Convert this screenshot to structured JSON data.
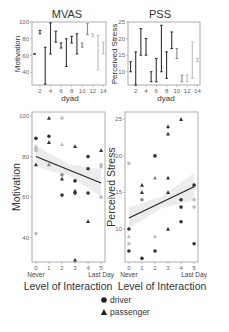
{
  "chart_data": [
    {
      "type": "dumbbell",
      "title": "MVAS",
      "xlabel": "dyad",
      "ylabel": "Motivation",
      "xlim": [
        0.5,
        14.5
      ],
      "ylim": [
        25,
        100
      ],
      "xticks": [
        2,
        4,
        6,
        8,
        10,
        12,
        14
      ],
      "yticks": [
        40,
        60,
        80,
        100
      ],
      "grid": false,
      "ranges": [
        {
          "dyad": 1,
          "low": 62,
          "high": 62,
          "shade": "dark"
        },
        {
          "dyad": 2,
          "low": 86,
          "high": 90,
          "shade": "dark"
        },
        {
          "dyad": 3,
          "low": 26,
          "high": 70,
          "shade": "dark"
        },
        {
          "dyad": 4,
          "low": 62,
          "high": 99,
          "shade": "dark"
        },
        {
          "dyad": 5,
          "low": 76,
          "high": 89,
          "shade": "dark"
        },
        {
          "dyad": 6,
          "low": 69,
          "high": 75,
          "shade": "dark"
        },
        {
          "dyad": 7,
          "low": 47,
          "high": 80,
          "shade": "dark"
        },
        {
          "dyad": 8,
          "low": 75,
          "high": 83,
          "shade": "dark"
        },
        {
          "dyad": 9,
          "low": 62,
          "high": 86,
          "shade": "dark"
        },
        {
          "dyad": 10,
          "low": 70,
          "high": 75,
          "shade": "mid"
        },
        {
          "dyad": 11,
          "low": 85,
          "high": 98,
          "shade": "mid"
        },
        {
          "dyad": 12,
          "low": 83,
          "high": 86,
          "shade": "light"
        },
        {
          "dyad": 13,
          "low": 43,
          "high": 84,
          "shade": "light"
        },
        {
          "dyad": 14,
          "low": 62,
          "high": 76,
          "shade": "light"
        }
      ]
    },
    {
      "type": "dumbbell",
      "title": "PSS",
      "xlabel": "dyad",
      "ylabel": "Perceived Stress",
      "xlim": [
        0.5,
        14.5
      ],
      "ylim": [
        6,
        25
      ],
      "xticks": [
        2,
        4,
        6,
        8,
        10,
        12,
        14
      ],
      "yticks": [
        10,
        15,
        20,
        25
      ],
      "grid": false,
      "ranges": [
        {
          "dyad": 1,
          "low": 10,
          "high": 13,
          "shade": "dark"
        },
        {
          "dyad": 2,
          "low": 6,
          "high": 16,
          "shade": "dark"
        },
        {
          "dyad": 3,
          "low": 15,
          "high": 23,
          "shade": "dark"
        },
        {
          "dyad": 4,
          "low": 15,
          "high": 20,
          "shade": "dark"
        },
        {
          "dyad": 5,
          "low": 7,
          "high": 10,
          "shade": "dark"
        },
        {
          "dyad": 6,
          "low": 7,
          "high": 14,
          "shade": "dark"
        },
        {
          "dyad": 7,
          "low": 10,
          "high": 24,
          "shade": "dark"
        },
        {
          "dyad": 8,
          "low": 8,
          "high": 16,
          "shade": "dark"
        },
        {
          "dyad": 9,
          "low": 17,
          "high": 22,
          "shade": "dark"
        },
        {
          "dyad": 10,
          "low": 14,
          "high": 17,
          "shade": "mid"
        },
        {
          "dyad": 11,
          "low": 7,
          "high": 9,
          "shade": "mid"
        },
        {
          "dyad": 12,
          "low": 7,
          "high": 9,
          "shade": "light"
        },
        {
          "dyad": 13,
          "low": 8,
          "high": 19,
          "shade": "light"
        },
        {
          "dyad": 14,
          "low": 13,
          "high": 14,
          "shade": "light"
        }
      ]
    },
    {
      "type": "scatter",
      "title": "",
      "xlabel": "Level of Interaction",
      "ylabel": "Motivation",
      "xlim": [
        -0.3,
        5.3
      ],
      "ylim": [
        28,
        102
      ],
      "xticks": [
        0,
        1,
        2,
        3,
        4,
        5
      ],
      "xtick_sublabels": {
        "0": "Never",
        "5": "Last Day"
      },
      "yticks": [
        40,
        60,
        80,
        100
      ],
      "grid": false,
      "regression": {
        "x0": 0,
        "y0": 80,
        "x1": 5,
        "y1": 67,
        "ci_band": true
      },
      "points": [
        {
          "x": 0,
          "y": 89,
          "shape": "circle",
          "shade": "dark"
        },
        {
          "x": 0,
          "y": 85,
          "shape": "triangle",
          "shade": "light"
        },
        {
          "x": 0,
          "y": 84,
          "shape": "circle",
          "shade": "light"
        },
        {
          "x": 0,
          "y": 83,
          "shape": "circle",
          "shade": "light"
        },
        {
          "x": 0,
          "y": 76,
          "shape": "triangle",
          "shade": "dark"
        },
        {
          "x": 0,
          "y": 42,
          "shape": "circle",
          "shade": "light"
        },
        {
          "x": 1,
          "y": 99,
          "shape": "triangle",
          "shade": "dark"
        },
        {
          "x": 1,
          "y": 90,
          "shape": "circle",
          "shade": "dark"
        },
        {
          "x": 1,
          "y": 87,
          "shape": "triangle",
          "shade": "dark"
        },
        {
          "x": 1,
          "y": 76,
          "shape": "triangle",
          "shade": "mid"
        },
        {
          "x": 2,
          "y": 99,
          "shape": "circle",
          "shade": "light"
        },
        {
          "x": 2,
          "y": 86,
          "shape": "triangle",
          "shade": "light"
        },
        {
          "x": 2,
          "y": 71,
          "shape": "circle",
          "shade": "mid"
        },
        {
          "x": 2,
          "y": 69,
          "shape": "triangle",
          "shade": "dark"
        },
        {
          "x": 2,
          "y": 61,
          "shape": "circle",
          "shade": "dark"
        },
        {
          "x": 3,
          "y": 85,
          "shape": "triangle",
          "shade": "dark"
        },
        {
          "x": 3,
          "y": 68,
          "shape": "circle",
          "shade": "dark"
        },
        {
          "x": 3,
          "y": 63,
          "shape": "triangle",
          "shade": "dark"
        },
        {
          "x": 3,
          "y": 62,
          "shape": "circle",
          "shade": "dark"
        },
        {
          "x": 3,
          "y": 29,
          "shape": "triangle",
          "shade": "dark"
        },
        {
          "x": 4,
          "y": 80,
          "shape": "circle",
          "shade": "dark"
        },
        {
          "x": 4,
          "y": 74,
          "shape": "circle",
          "shade": "dark"
        },
        {
          "x": 4,
          "y": 62,
          "shape": "circle",
          "shade": "dark"
        },
        {
          "x": 4,
          "y": 48,
          "shape": "triangle",
          "shade": "dark"
        },
        {
          "x": 5,
          "y": 83,
          "shape": "triangle",
          "shade": "dark"
        },
        {
          "x": 5,
          "y": 76,
          "shape": "circle",
          "shade": "light"
        },
        {
          "x": 5,
          "y": 75,
          "shape": "circle",
          "shade": "light"
        },
        {
          "x": 5,
          "y": 60,
          "shape": "circle",
          "shade": "light"
        }
      ]
    },
    {
      "type": "scatter",
      "title": "",
      "xlabel": "Level of Interaction",
      "ylabel": "Perceived Stress",
      "xlim": [
        -0.3,
        5.3
      ],
      "ylim": [
        5.5,
        26
      ],
      "xticks": [
        0,
        1,
        2,
        3,
        4,
        5
      ],
      "xtick_sublabels": {
        "0": "Never",
        "5": "Last Day"
      },
      "yticks": [
        10,
        15,
        20,
        25
      ],
      "grid": false,
      "regression": {
        "x0": 0,
        "y0": 11.5,
        "x1": 5,
        "y1": 15.8,
        "ci_band": true
      },
      "points": [
        {
          "x": 0,
          "y": 19,
          "shape": "circle",
          "shade": "light"
        },
        {
          "x": 0,
          "y": 10,
          "shape": "circle",
          "shade": "dark"
        },
        {
          "x": 0,
          "y": 9,
          "shape": "triangle",
          "shade": "light"
        },
        {
          "x": 0,
          "y": 8,
          "shape": "circle",
          "shade": "light"
        },
        {
          "x": 0,
          "y": 7,
          "shape": "circle",
          "shade": "dark"
        },
        {
          "x": 1,
          "y": 16,
          "shape": "triangle",
          "shade": "dark"
        },
        {
          "x": 1,
          "y": 15,
          "shape": "triangle",
          "shade": "dark"
        },
        {
          "x": 1,
          "y": 14,
          "shape": "circle",
          "shade": "mid"
        },
        {
          "x": 1,
          "y": 6,
          "shape": "circle",
          "shade": "dark"
        },
        {
          "x": 2,
          "y": 20,
          "shape": "circle",
          "shade": "dark"
        },
        {
          "x": 2,
          "y": 17,
          "shape": "triangle",
          "shade": "mid"
        },
        {
          "x": 2,
          "y": 9,
          "shape": "triangle",
          "shade": "light"
        },
        {
          "x": 2,
          "y": 7,
          "shape": "circle",
          "shade": "dark"
        },
        {
          "x": 3,
          "y": 24,
          "shape": "triangle",
          "shade": "dark"
        },
        {
          "x": 3,
          "y": 23,
          "shape": "triangle",
          "shade": "dark"
        },
        {
          "x": 3,
          "y": 17,
          "shape": "triangle",
          "shade": "dark"
        },
        {
          "x": 3,
          "y": 15,
          "shape": "triangle",
          "shade": "dark"
        },
        {
          "x": 3,
          "y": 10,
          "shape": "triangle",
          "shade": "dark"
        },
        {
          "x": 4,
          "y": 25,
          "shape": "triangle",
          "shade": "dark"
        },
        {
          "x": 4,
          "y": 14,
          "shape": "circle",
          "shade": "dark"
        },
        {
          "x": 4,
          "y": 13,
          "shape": "circle",
          "shade": "dark"
        },
        {
          "x": 4,
          "y": 11,
          "shape": "circle",
          "shade": "dark"
        },
        {
          "x": 5,
          "y": 16,
          "shape": "circle",
          "shade": "dark"
        },
        {
          "x": 5,
          "y": 14,
          "shape": "circle",
          "shade": "light"
        },
        {
          "x": 5,
          "y": 13,
          "shape": "circle",
          "shade": "light"
        },
        {
          "x": 5,
          "y": 8,
          "shape": "circle",
          "shade": "dark"
        }
      ]
    }
  ],
  "legend": {
    "items": [
      {
        "label": "driver",
        "shape": "circle"
      },
      {
        "label": "passenger",
        "shape": "triangle"
      }
    ]
  },
  "colors": {
    "dark": "#333333",
    "mid": "#8a8a8a",
    "light": "#bdbdbd",
    "ci_band": "#ececec",
    "frame": "#999999"
  }
}
